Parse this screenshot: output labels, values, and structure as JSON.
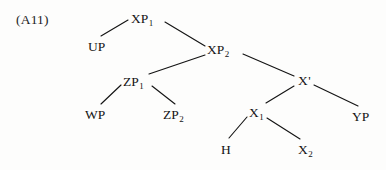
{
  "figure": {
    "example_label": "(A11)",
    "type": "syntax-tree",
    "ink_color": "#141414",
    "background_color": "#fdfdfc"
  },
  "nodes": [
    {
      "id": "xp1",
      "base": "XP",
      "sub": "1",
      "prime": "",
      "text": "XP1",
      "x": 131,
      "y": 12
    },
    {
      "id": "up",
      "base": "UP",
      "sub": "",
      "prime": "",
      "text": "UP",
      "x": 88,
      "y": 40
    },
    {
      "id": "xp2",
      "base": "XP",
      "sub": "2",
      "prime": "",
      "text": "XP2",
      "x": 207,
      "y": 43
    },
    {
      "id": "zp1",
      "base": "ZP",
      "sub": "1",
      "prime": "",
      "text": "ZP1",
      "x": 123,
      "y": 75
    },
    {
      "id": "xbar",
      "base": "X",
      "sub": "",
      "prime": "'",
      "text": "X'",
      "x": 298,
      "y": 74
    },
    {
      "id": "wp",
      "base": "WP",
      "sub": "",
      "prime": "",
      "text": "WP",
      "x": 85,
      "y": 108
    },
    {
      "id": "zp2",
      "base": "ZP",
      "sub": "2",
      "prime": "",
      "text": "ZP2",
      "x": 163,
      "y": 108
    },
    {
      "id": "x1",
      "base": "X",
      "sub": "1",
      "prime": "",
      "text": "X1",
      "x": 249,
      "y": 106
    },
    {
      "id": "yp",
      "base": "YP",
      "sub": "",
      "prime": "",
      "text": "YP",
      "x": 352,
      "y": 110
    },
    {
      "id": "h",
      "base": "H",
      "sub": "",
      "prime": "",
      "text": "H",
      "x": 221,
      "y": 143
    },
    {
      "id": "x2",
      "base": "X",
      "sub": "2",
      "prime": "",
      "text": "X2",
      "x": 298,
      "y": 143
    }
  ],
  "branches": [
    {
      "id": "xp1-up",
      "from": "xp1",
      "to": "up",
      "x1": 128,
      "y1": 20,
      "x2": 101,
      "y2": 36
    },
    {
      "id": "xp1-xp2",
      "from": "xp1",
      "to": "xp2",
      "x1": 165,
      "y1": 22,
      "x2": 205,
      "y2": 46
    },
    {
      "id": "xp2-zp1",
      "from": "xp2",
      "to": "zp1",
      "x1": 205,
      "y1": 55,
      "x2": 149,
      "y2": 74
    },
    {
      "id": "xp2-xbar",
      "from": "xp2",
      "to": "xbar",
      "x1": 243,
      "y1": 54,
      "x2": 294,
      "y2": 76
    },
    {
      "id": "zp1-wp",
      "from": "zp1",
      "to": "wp",
      "x1": 121,
      "y1": 85,
      "x2": 101,
      "y2": 104
    },
    {
      "id": "zp1-zp2",
      "from": "zp1",
      "to": "zp2",
      "x1": 152,
      "y1": 86,
      "x2": 175,
      "y2": 104
    },
    {
      "id": "xbar-x1",
      "from": "xbar",
      "to": "x1",
      "x1": 294,
      "y1": 86,
      "x2": 266,
      "y2": 103
    },
    {
      "id": "xbar-yp",
      "from": "xbar",
      "to": "yp",
      "x1": 314,
      "y1": 85,
      "x2": 358,
      "y2": 106
    },
    {
      "id": "x1-h",
      "from": "x1",
      "to": "h",
      "x1": 247,
      "y1": 117,
      "x2": 229,
      "y2": 138
    },
    {
      "id": "x1-x2",
      "from": "x1",
      "to": "x2",
      "x1": 267,
      "y1": 118,
      "x2": 300,
      "y2": 139
    }
  ]
}
